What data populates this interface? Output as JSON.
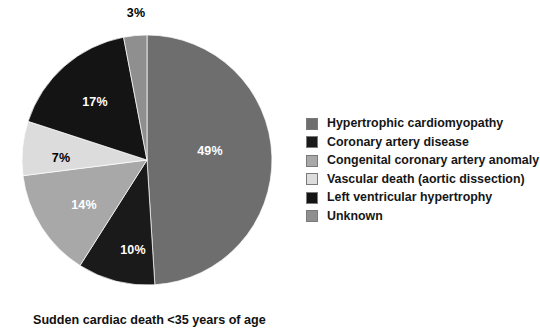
{
  "chart_data": {
    "type": "pie",
    "title": "Sudden cardiac death <35 years of age",
    "caption": "Sudden cardiac death <35 years of age",
    "legend_position": "right",
    "start_angle_deg": 0,
    "direction": "clockwise",
    "center": {
      "x": 147,
      "y": 160
    },
    "radius": 125,
    "categories": [
      "Hypertrophic cardiomyopathy",
      "Coronary artery disease",
      "Congenital coronary artery anomaly",
      "Vascular death (aortic dissection)",
      "Left ventricular hypertrophy",
      "Unknown"
    ],
    "values": [
      49,
      10,
      14,
      7,
      17,
      3
    ],
    "value_labels": [
      "49%",
      "10%",
      "14%",
      "7%",
      "17%",
      "3%"
    ],
    "colors": [
      "#6e6e6e",
      "#1a1a1a",
      "#a8a8a8",
      "#dcdcdc",
      "#141414",
      "#8f8f8f"
    ],
    "slices": [
      {
        "label": "Hypertrophic cardiomyopathy",
        "value": 49,
        "display": "49%",
        "color": "#6e6e6e",
        "label_color": "white",
        "label_x": 210,
        "label_y": 151
      },
      {
        "label": "Coronary artery disease",
        "value": 10,
        "display": "10%",
        "color": "#1a1a1a",
        "label_color": "white",
        "label_x": 133,
        "label_y": 250
      },
      {
        "label": "Congenital coronary artery anomaly",
        "value": 14,
        "display": "14%",
        "color": "#a8a8a8",
        "label_color": "white",
        "label_x": 84,
        "label_y": 205
      },
      {
        "label": "Vascular death (aortic dissection)",
        "value": 7,
        "display": "7%",
        "color": "#dcdcdc",
        "label_color": "black",
        "label_x": 61,
        "label_y": 158
      },
      {
        "label": "Left ventricular hypertrophy",
        "value": 17,
        "display": "17%",
        "color": "#141414",
        "label_color": "white",
        "label_x": 95,
        "label_y": 102
      },
      {
        "label": "Unknown",
        "value": 3,
        "display": "3%",
        "color": "#8f8f8f",
        "label_color": "black",
        "label_x": 136,
        "label_y": 13
      }
    ]
  },
  "legend": {
    "items": [
      {
        "label": "Hypertrophic cardiomyopathy",
        "color": "#6e6e6e"
      },
      {
        "label": "Coronary artery disease",
        "color": "#1a1a1a"
      },
      {
        "label": "Congenital coronary artery anomaly",
        "color": "#a8a8a8"
      },
      {
        "label": "Vascular death (aortic dissection)",
        "color": "#dcdcdc"
      },
      {
        "label": "Left ventricular hypertrophy",
        "color": "#141414"
      },
      {
        "label": "Unknown",
        "color": "#8f8f8f"
      }
    ]
  },
  "caption": {
    "text": "Sudden cardiac death <35 years of age"
  }
}
